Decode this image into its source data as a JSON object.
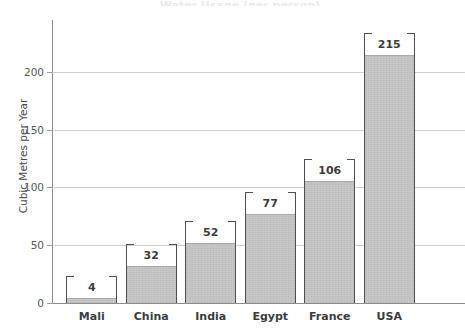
{
  "chart_data": {
    "type": "bar",
    "title": "Water Usage (per person)",
    "title_cropped": true,
    "xlabel": "",
    "ylabel": "Cubic Metres per Year",
    "categories": [
      "Mali",
      "China",
      "India",
      "Egypt",
      "France",
      "USA"
    ],
    "values": [
      4,
      32,
      52,
      77,
      106,
      215
    ],
    "value_labels": [
      "4",
      "32",
      "52",
      "77",
      "106",
      "215"
    ],
    "ylim": [
      0,
      245
    ],
    "yticks": [
      0,
      50,
      100,
      150,
      200
    ],
    "ytick_labels": [
      "0",
      "50",
      "100",
      "150",
      "200"
    ],
    "grid": true,
    "grid_axis": "y",
    "legend": false,
    "bar_fill_color": "#c6c6c6",
    "bar_edge_color": "#6f6f6f",
    "grid_color": "#d0d0d0",
    "axis_color": "#8c8c8c",
    "text_color": "#3c3c3e",
    "tick_text_color": "#58585a",
    "background_color": "#ffffff",
    "annotation_style": "caliper-brackets"
  }
}
